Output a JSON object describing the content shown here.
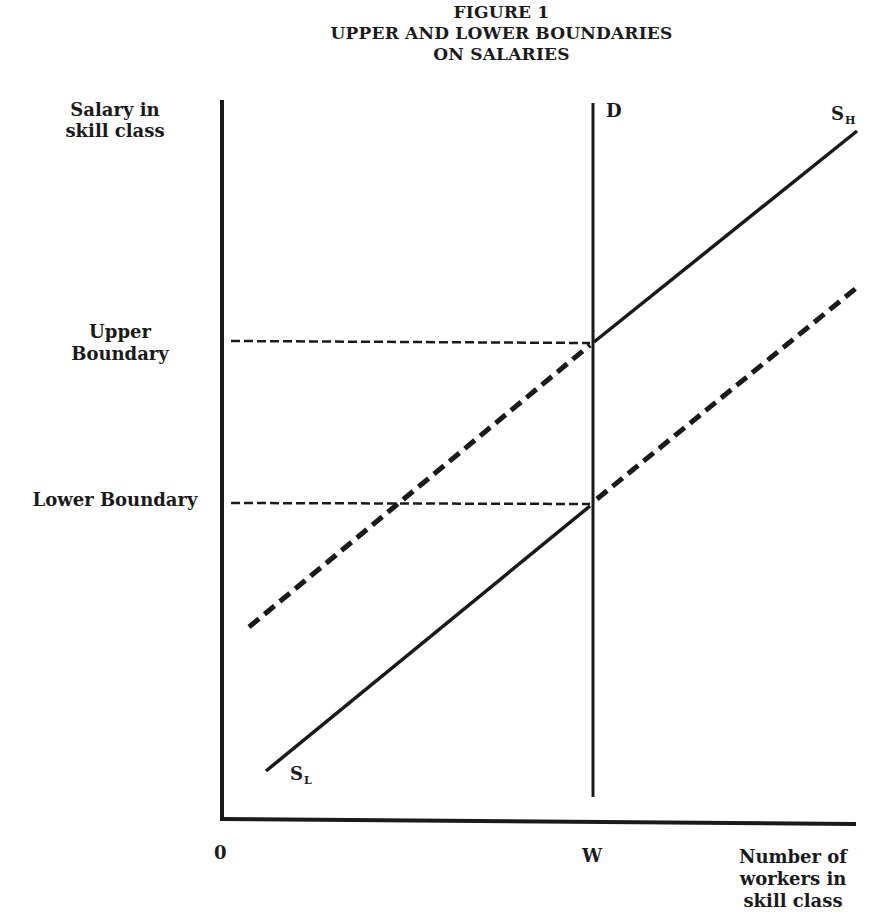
{
  "figure": {
    "number": "FIGURE 1",
    "title_line1": "UPPER AND LOWER BOUNDARIES",
    "title_line2": "ON SALARIES"
  },
  "axes": {
    "y_label_line1": "Salary in",
    "y_label_line2": "skill class",
    "x_label_line1": "Number of",
    "x_label_line2": "workers in",
    "x_label_line3": "skill class",
    "origin_label": "0",
    "x_tick_label": "W"
  },
  "boundaries": {
    "upper_line1": "Upper",
    "upper_line2": "Boundary",
    "lower": "Lower Boundary"
  },
  "curves": {
    "demand_label": "D",
    "high_supply_label": "S",
    "high_supply_sub": "H",
    "low_supply_label": "S",
    "low_supply_sub": "L"
  },
  "colors": {
    "ink": "#1a1a1a",
    "background": "#ffffff"
  }
}
